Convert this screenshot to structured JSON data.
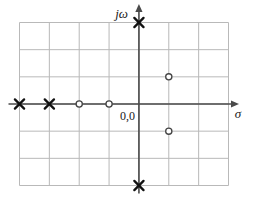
{
  "figure": {
    "title": "",
    "background_color": "#ffffff",
    "width": 254,
    "height": 206
  },
  "labels": {
    "imaginary_axis": "jω",
    "real_axis": "σ",
    "origin": "0,0"
  },
  "colors": {
    "grid": "#b9b9b9",
    "axis": "#4a4a4a",
    "pole": "#111111",
    "zero": "#444444",
    "text": "#1a1a1a"
  },
  "chart_data": {
    "type": "scatter",
    "title": "",
    "subtitle": "",
    "xlabel": "σ",
    "ylabel": "jω",
    "grid": true,
    "legend_position": "none",
    "annotations": [
      {
        "text": "0,0",
        "x": -0.45,
        "y": -0.45,
        "role": "origin-label"
      },
      {
        "text": "jω",
        "x": -0.35,
        "y": 3.3,
        "role": "axis-label"
      },
      {
        "text": "σ",
        "x": 3.2,
        "y": -0.45,
        "role": "axis-label"
      }
    ],
    "xlim": [
      -4,
      3
    ],
    "ylim": [
      -3,
      3
    ],
    "xticks": [
      -4,
      -3,
      -2,
      -1,
      0,
      1,
      2,
      3
    ],
    "yticks": [
      -3,
      -2,
      -1,
      0,
      1,
      2,
      3
    ],
    "xtick_labels": [
      "",
      "",
      "",
      "",
      "",
      "",
      "",
      ""
    ],
    "ytick_labels": [
      "",
      "",
      "",
      "",
      "",
      "",
      ""
    ],
    "series": [
      {
        "name": "poles",
        "marker": "x",
        "points": [
          {
            "x": -4,
            "y": 0
          },
          {
            "x": -3,
            "y": 0
          },
          {
            "x": 0,
            "y": 3
          },
          {
            "x": 0,
            "y": -3
          }
        ]
      },
      {
        "name": "zeros",
        "marker": "o",
        "points": [
          {
            "x": -2,
            "y": 0
          },
          {
            "x": -1,
            "y": 0
          },
          {
            "x": 1,
            "y": 1
          },
          {
            "x": 1,
            "y": -1
          }
        ]
      }
    ]
  }
}
